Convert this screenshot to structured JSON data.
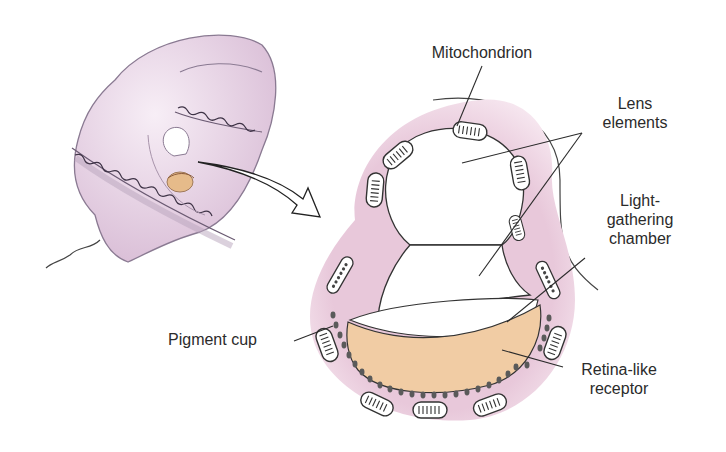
{
  "figure": {
    "colors": {
      "cell_body": "#e6d0e2",
      "cell_outline": "#8a7a92",
      "tissue": "#e8c6da",
      "receptor": "#f1cca4",
      "lens": "#ffffff",
      "line": "#2b2b2b",
      "pigment": "#555555"
    }
  },
  "labels": {
    "mitochondrion": "Mitochondrion",
    "lens_line1": "Lens",
    "lens_line2": "elements",
    "chamber_line1": "Light-",
    "chamber_line2": "gathering",
    "chamber_line3": "chamber",
    "pigment_cup": "Pigment cup",
    "retina_line1": "Retina-like",
    "retina_line2": "receptor"
  }
}
